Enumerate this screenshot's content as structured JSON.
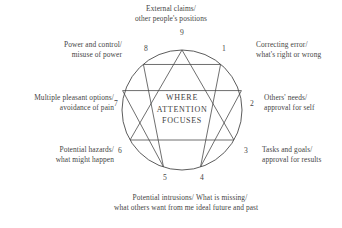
{
  "diagram": {
    "center_text": {
      "line1": "WHERE",
      "line2": "ATTENTION",
      "line3": "FOCUSES"
    },
    "colors": {
      "ink": "#454545",
      "line": "#4a4a4a",
      "background": "#ffffff"
    },
    "geometry": {
      "center_x": 182,
      "center_y": 110,
      "radius": 60,
      "triangle": [
        9,
        3,
        6
      ],
      "hexad": [
        1,
        4,
        2,
        8,
        5,
        7
      ]
    },
    "points": [
      {
        "number": "9",
        "line1": "External claims/",
        "line2": "other people's positions"
      },
      {
        "number": "1",
        "line1": "Correcting error/",
        "line2": "what's right or wrong"
      },
      {
        "number": "2",
        "line1": "Others' needs/",
        "line2": "approval for self"
      },
      {
        "number": "3",
        "line1": "Tasks and goals/",
        "line2": "approval for results"
      },
      {
        "number": "4",
        "line1": "What is missing/",
        "line2": "ideal future and past"
      },
      {
        "number": "5",
        "line1": "Potential intrusions/",
        "line2": "what others want from me"
      },
      {
        "number": "6",
        "line1": "Potential hazards/",
        "line2": "what might happen"
      },
      {
        "number": "7",
        "line1": "Multiple pleasant options/",
        "line2": "avoidance of pain"
      },
      {
        "number": "8",
        "line1": "Power and control/",
        "line2": "misuse of power"
      }
    ]
  }
}
